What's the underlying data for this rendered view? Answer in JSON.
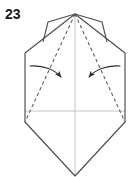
{
  "figure": {
    "step_number": "23",
    "kind": "origami-folding-diagram",
    "caption": "",
    "canvas": {
      "width": 134,
      "height": 177
    },
    "colors": {
      "background": "#ffffff",
      "outline": "#4d4d4d",
      "fold_dash": "#555555",
      "center_guide": "#b8b8b8",
      "arrow": "#2b2b2b",
      "label": "#1a1a1a"
    },
    "parts": {
      "outline_label": "paper outline",
      "left_flap_label": "left top flap",
      "right_flap_label": "right top flap",
      "left_fold_label": "left valley fold line",
      "right_fold_label": "right valley fold line",
      "vertical_guide_label": "vertical center guide",
      "horizontal_guide_label": "horizontal center guide",
      "left_arrow_label": "left fold arrow",
      "right_arrow_label": "right fold arrow"
    },
    "geometry": {
      "apex": [
        75,
        14
      ],
      "left_shoulder": [
        25,
        53
      ],
      "right_shoulder": [
        125,
        53
      ],
      "left_corner": [
        25,
        122
      ],
      "right_corner": [
        125,
        122
      ],
      "bottom_tip": [
        75,
        176
      ],
      "left_flap_outer_top": [
        48,
        22
      ],
      "left_flap_outer_bottom": [
        43,
        42
      ],
      "right_flap_outer_top": [
        102,
        22
      ],
      "right_flap_outer_bottom": [
        107,
        42
      ]
    }
  }
}
